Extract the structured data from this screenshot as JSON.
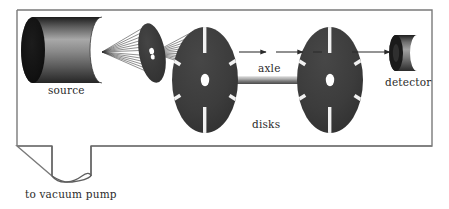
{
  "figure": {
    "background_color": "#ffffff",
    "ink_color": "#2b2b2b"
  },
  "chamber": {
    "name": "vacuum-chamber",
    "x": 17,
    "y": 10,
    "width": 415,
    "height": 136,
    "border_color": "#7a7a7a",
    "border_width": 1.4,
    "fill": "#ffffff"
  },
  "labels": {
    "source": "source",
    "axle": "axle",
    "disks": "disks",
    "detector": "detector",
    "vacuum_pump": "to vacuum pump"
  },
  "components": {
    "source": {
      "name": "source-cylinder",
      "cx_left": 33,
      "cx_right": 102,
      "cy": 50,
      "ry": 33,
      "rx": 12,
      "face_color": "#151515",
      "body_gradient": [
        "#1b1b1b",
        "#9a9a9a",
        "#6e6e6e",
        "#2e2e2e"
      ],
      "aperture_x": 102,
      "aperture_y": 52
    },
    "collimator": {
      "name": "collimator-disk",
      "cx": 152,
      "cy": 53,
      "rx": 13,
      "ry": 30,
      "tilt_deg": -10,
      "color": "#3a3a3a",
      "hole_color": "#ffffff",
      "hole_rx": 2.4,
      "hole_ry": 3.2
    },
    "disk_one": {
      "name": "slotted-disk-near",
      "cx": 205,
      "cy": 80,
      "rx": 33,
      "ry": 53,
      "color": "#3d3d3d",
      "slot_color": "#f2f2f2",
      "hub_color": "#ffffff",
      "slot_count": 6,
      "slot_angles_deg": [
        90,
        150,
        210,
        270,
        330,
        30
      ]
    },
    "disk_two": {
      "name": "slotted-disk-far",
      "cx": 330,
      "cy": 80,
      "rx": 33,
      "ry": 53,
      "color": "#3d3d3d",
      "slot_color": "#f2f2f2",
      "hub_color": "#ffffff",
      "slot_count": 6,
      "slot_angles_deg": [
        90,
        150,
        210,
        270,
        330,
        30
      ]
    },
    "axle": {
      "name": "connecting-axle",
      "x1": 205,
      "x2": 330,
      "y": 80,
      "thickness": 7,
      "gradient": [
        "#cfcfcf",
        "#8d8d8d",
        "#4d4d4d"
      ]
    },
    "detector": {
      "name": "detector-cylinder",
      "cx_left": 396,
      "cx_right": 417,
      "cy": 53,
      "ry": 18,
      "rx": 7,
      "face_color": "#1a1a1a",
      "body_gradient": [
        "#2a2a2a",
        "#8f8f8f",
        "#3a3a3a"
      ]
    },
    "beam_fan": {
      "name": "beam-ray-fan",
      "origin_x": 102,
      "origin_y": 52,
      "focus_x": 152,
      "focus_y": 53,
      "exit_x": 205,
      "exit_y": 55,
      "ray_count": 13,
      "spread_ry": 26,
      "color": "#2b2b2b"
    },
    "beam_arrows": {
      "name": "beam-arrow-track",
      "y": 52,
      "x_start": 239,
      "x_end": 392,
      "color": "#2b2b2b",
      "segments": [
        {
          "x1": 239,
          "x2": 268
        },
        {
          "x1": 276,
          "x2": 305
        },
        {
          "x1": 313,
          "x2": 322
        },
        {
          "x1": 352,
          "x2": 392
        }
      ],
      "arrow_heads_x": [
        268,
        305,
        392
      ]
    },
    "vacuum_line": {
      "name": "vacuum-pump-tube",
      "left_x": 52,
      "right_x": 91,
      "top_y": 146,
      "bottom_y": 178,
      "color": "#5e5e5e",
      "width": 1.3,
      "loop_name": "bowtie-crossover"
    }
  }
}
